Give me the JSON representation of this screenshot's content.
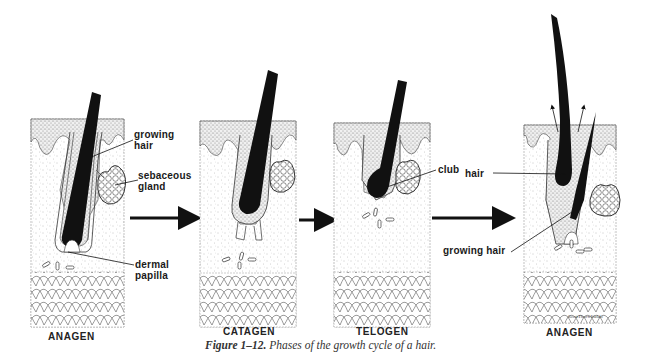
{
  "figure": {
    "caption_label": "Figure 1–12.",
    "caption_text": "Phases of the growth cycle of a hair."
  },
  "panels": [
    {
      "phase": "ANAGEN",
      "labels": [
        "growing hair",
        "sebaceous gland",
        "dermal papilla"
      ]
    },
    {
      "phase": "CATAGEN",
      "labels": []
    },
    {
      "phase": "TELOGEN",
      "labels": [
        "club hair"
      ]
    },
    {
      "phase": "ANAGEN",
      "labels": [
        "growing hair"
      ]
    }
  ],
  "labels": {
    "growing_hair_1": "growing",
    "growing_hair_2": "hair",
    "sebaceous_1": "sebaceous",
    "sebaceous_2": "gland",
    "dermal_1": "dermal",
    "dermal_2": "papilla",
    "club": "club",
    "club_hair": "hair",
    "growing_hair_right": "growing hair"
  },
  "signature": "Scott Thorn Waldo",
  "colors": {
    "ink": "#111111",
    "stipple": "#9a9a9a",
    "background": "#ffffff"
  }
}
